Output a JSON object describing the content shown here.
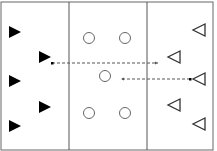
{
  "diagram": {
    "colors": {
      "line": "#555555",
      "filled": "#000000",
      "outline": "#333333",
      "arrow": "#555555"
    },
    "zones": [
      {
        "name": "left-zone",
        "x1": 1,
        "x2": 69
      },
      {
        "name": "middle-zone",
        "x1": 69,
        "x2": 147
      },
      {
        "name": "right-zone",
        "x1": 147,
        "x2": 213
      }
    ],
    "filled_triangles": [
      {
        "x": 15,
        "y": 32
      },
      {
        "x": 45,
        "y": 57
      },
      {
        "x": 15,
        "y": 81
      },
      {
        "x": 45,
        "y": 107
      },
      {
        "x": 15,
        "y": 126
      }
    ],
    "circles": [
      {
        "x": 89,
        "y": 38
      },
      {
        "x": 125,
        "y": 38
      },
      {
        "x": 105,
        "y": 76
      },
      {
        "x": 89,
        "y": 113
      },
      {
        "x": 125,
        "y": 113
      }
    ],
    "outline_triangles": [
      {
        "x": 199,
        "y": 30
      },
      {
        "x": 174,
        "y": 57
      },
      {
        "x": 199,
        "y": 79
      },
      {
        "x": 174,
        "y": 105
      },
      {
        "x": 199,
        "y": 124
      }
    ],
    "arrows": [
      {
        "from": [
          52,
          63
        ],
        "to": [
          158,
          63
        ],
        "style": "dashed"
      },
      {
        "from": [
          190,
          79
        ],
        "to": [
          121,
          79
        ],
        "style": "dashed"
      }
    ]
  }
}
